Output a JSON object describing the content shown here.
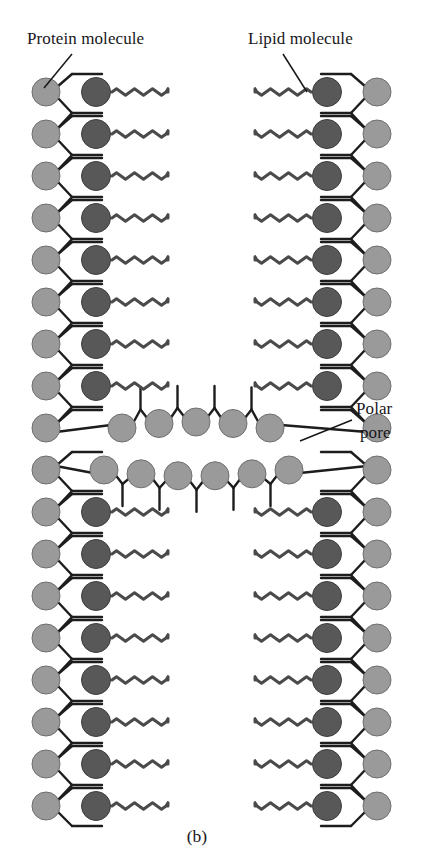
{
  "figure": {
    "caption": "(b)",
    "kind": "lipid-bilayer-with-polar-pore-diagram"
  },
  "labels": {
    "protein": "Protein molecule",
    "lipid": "Lipid molecule",
    "polar_pore_line1": "Polar",
    "polar_pore_line2": "pore"
  },
  "colors": {
    "protein_head": "#9a9a9a",
    "protein_head_stroke": "#6f6f6f",
    "lipid_head": "#585858",
    "lipid_head_stroke": "#3c3c3c",
    "stroke": "#1d1d1d",
    "tail": "#4a4a4a",
    "text": "#17161a",
    "background": "#ffffff"
  },
  "geometry": {
    "width": 423,
    "height": 858,
    "protein_radius": 14,
    "lipid_radius": 14.5,
    "pore_radius": 14,
    "row_spacing": 42,
    "left_protein_x": 46,
    "left_lipid_x": 96,
    "left_tail_start": 112,
    "left_tail_end": 168,
    "right_protein_x": 377,
    "right_lipid_x": 327,
    "right_tail_start": 255,
    "right_tail_end": 311,
    "tail_amplitude": 3.3,
    "tail_period": 9.0,
    "upper_first_row_y": 92,
    "lower_first_row_y": 512
  },
  "structure": {
    "upper_leaflet": {
      "lipid_rows": 8,
      "row_y": [
        92,
        134,
        176,
        218,
        260,
        302,
        344,
        386
      ],
      "terminal_protein_y": 428,
      "description": "upper leaflet lipid rows with protein chain on outer edges"
    },
    "lower_leaflet": {
      "lipid_rows": 8,
      "row_y": [
        512,
        554,
        596,
        638,
        680,
        722,
        764,
        806
      ],
      "leading_protein_y": 470,
      "description": "lower leaflet lipid rows with protein chain on outer edges"
    },
    "pore": {
      "upper_row_count": 5,
      "upper_row_y": 428,
      "upper_row_x": [
        122,
        159,
        196,
        233,
        270
      ],
      "lower_row_count": 6,
      "lower_row_y": 470,
      "lower_row_x": [
        104,
        141,
        178,
        215,
        252,
        289
      ],
      "description": "two curved rows of polar protein heads lining the aqueous pore"
    }
  },
  "annotations": {
    "protein_leader": {
      "from_x": 72,
      "from_y": 54,
      "to_x": 44,
      "to_y": 88
    },
    "lipid_leader": {
      "from_x": 283,
      "from_y": 54,
      "to_x": 307,
      "to_y": 92
    },
    "pore_leader": {
      "from_x": 300,
      "from_y": 441,
      "to_x": 352,
      "to_y": 420
    }
  },
  "label_positions": {
    "protein_x": 27,
    "protein_y": 44,
    "lipid_x": 248,
    "lipid_y": 44,
    "polar_x": 356,
    "polar_y": 414,
    "pore_x": 360,
    "pore_y": 438,
    "caption_x": 197,
    "caption_y": 842
  }
}
